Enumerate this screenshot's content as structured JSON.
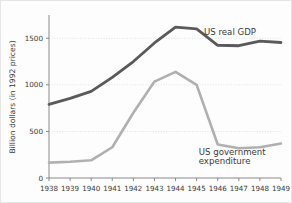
{
  "chart_data": {
    "type": "line",
    "title": "",
    "xlabel": "",
    "ylabel": "Billion dollars (in 1992 prices)",
    "x": [
      1938,
      1939,
      1940,
      1941,
      1942,
      1943,
      1944,
      1945,
      1946,
      1947,
      1948,
      1949
    ],
    "categories": [
      "1938",
      "1939",
      "1940",
      "1941",
      "1942",
      "1943",
      "1944",
      "1945",
      "1946",
      "1947",
      "1948",
      "1949"
    ],
    "ylim": [
      0,
      1750
    ],
    "xlim": [
      1938,
      1949
    ],
    "yticks": [
      0,
      500,
      1000,
      1500
    ],
    "ytick_labels": [
      "0",
      "500",
      "1000",
      "1500"
    ],
    "grid": true,
    "legend_position": "inline-annotation",
    "series": [
      {
        "name": "US real GDP",
        "color": "#5a5a5a",
        "values": [
          790,
          855,
          930,
          1080,
          1250,
          1450,
          1620,
          1600,
          1425,
          1420,
          1470,
          1455
        ],
        "label_x": 1945.35,
        "label_y": 1540
      },
      {
        "name": "US government expenditure",
        "color": "#b0b0b0",
        "values": [
          165,
          175,
          190,
          330,
          700,
          1035,
          1140,
          1000,
          360,
          320,
          330,
          370
        ],
        "label_x": 1945.1,
        "label_y": 250
      }
    ],
    "annotations": [
      {
        "text": "US real GDP",
        "name": "gdp-series-label"
      },
      {
        "text": "US government",
        "name": "gov-series-label-line1"
      },
      {
        "text": "expenditure",
        "name": "gov-series-label-line2"
      }
    ]
  },
  "axis": {
    "y_title": "Billion dollars (in 1992 prices)",
    "y_ticks": [
      "1500",
      "1000",
      "500",
      "0"
    ],
    "x_ticks": [
      "1938",
      "1939",
      "1940",
      "1941",
      "1942",
      "1943",
      "1944",
      "1945",
      "1946",
      "1947",
      "1948",
      "1949"
    ]
  },
  "labels": {
    "gdp": "US real GDP",
    "gov_line1": "US government",
    "gov_line2": "expenditure"
  },
  "colors": {
    "gdp_line": "#5a5a5a",
    "gov_line": "#b0b0b0",
    "grid": "#d8d8d8",
    "axis": "#8a8a8a",
    "text": "#3a3a3a",
    "background": "#fdfdfd"
  }
}
